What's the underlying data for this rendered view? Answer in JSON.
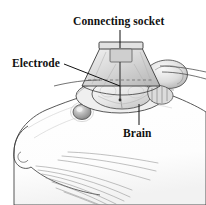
{
  "figure": {
    "background_color": "#ffffff",
    "ink_color": "#111111",
    "shading_color": "#9a9a9a",
    "width": 206,
    "height": 205
  },
  "labels": {
    "connecting_socket": "Connecting  socket",
    "electrode": "Electrode",
    "brain": "Brain"
  },
  "leader_lines": [
    {
      "name": "connecting-socket-leader",
      "from_label": "connecting_socket",
      "orientation": "vertical",
      "x1": 120,
      "y1": 30,
      "x2": 120,
      "y2": 48
    },
    {
      "name": "electrode-leader",
      "from_label": "electrode",
      "orientation": "diagonal",
      "x1": 64,
      "y1": 64,
      "x2": 120,
      "y2": 86
    },
    {
      "name": "brain-leader",
      "from_label": "brain",
      "orientation": "vertical",
      "x1": 139,
      "y1": 125,
      "x2": 139,
      "y2": 104
    }
  ],
  "parts": [
    {
      "name": "connecting-socket",
      "shape": "trapezoid dome on top of skull"
    },
    {
      "name": "socket-top-plate",
      "shape": "flat rectangular plate with pin"
    },
    {
      "name": "brain",
      "shape": "rounded pale mass beneath socket"
    },
    {
      "name": "skull-cap",
      "shape": "exposed cranium ring"
    },
    {
      "name": "ear",
      "shape": "rounded pinna at right"
    },
    {
      "name": "eye",
      "shape": "small shaded oval"
    },
    {
      "name": "nose",
      "shape": "blunt snout tip at left"
    },
    {
      "name": "whiskers",
      "shape": "fan of fine curved lines"
    }
  ]
}
